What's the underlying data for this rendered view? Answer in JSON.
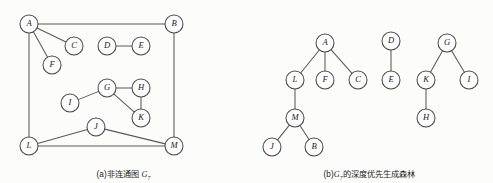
{
  "figure": {
    "panels": [
      {
        "id": "panel-a",
        "caption_prefix": "(a)",
        "caption_text": "非连通图",
        "caption_symbol": "G",
        "caption_subscript": "7",
        "type": "undirected-graph",
        "node_radius": 9,
        "nodes": [
          {
            "label": "A",
            "x": 29,
            "y": 24
          },
          {
            "label": "B",
            "x": 174,
            "y": 24
          },
          {
            "label": "C",
            "x": 74,
            "y": 46
          },
          {
            "label": "D",
            "x": 107,
            "y": 46
          },
          {
            "label": "E",
            "x": 141,
            "y": 46
          },
          {
            "label": "F",
            "x": 52,
            "y": 65
          },
          {
            "label": "G",
            "x": 107,
            "y": 88
          },
          {
            "label": "H",
            "x": 141,
            "y": 88
          },
          {
            "label": "I",
            "x": 70,
            "y": 103
          },
          {
            "label": "K",
            "x": 141,
            "y": 118
          },
          {
            "label": "J",
            "x": 96,
            "y": 127
          },
          {
            "label": "L",
            "x": 29,
            "y": 146
          },
          {
            "label": "M",
            "x": 174,
            "y": 146
          }
        ],
        "edges": [
          [
            "A",
            "B"
          ],
          [
            "A",
            "C"
          ],
          [
            "A",
            "F"
          ],
          [
            "A",
            "L"
          ],
          [
            "B",
            "M"
          ],
          [
            "D",
            "E"
          ],
          [
            "G",
            "H"
          ],
          [
            "G",
            "I"
          ],
          [
            "G",
            "K"
          ],
          [
            "H",
            "K"
          ],
          [
            "J",
            "L"
          ],
          [
            "J",
            "M"
          ],
          [
            "L",
            "M"
          ]
        ]
      },
      {
        "id": "panel-b",
        "caption_prefix": "(b)",
        "caption_symbol": "G",
        "caption_subscript": "7",
        "caption_text": "的深度优先生成森林",
        "type": "spanning-forest",
        "node_radius": 9,
        "nodes": [
          {
            "label": "A",
            "x": 79,
            "y": 43
          },
          {
            "label": "L",
            "x": 49,
            "y": 80
          },
          {
            "label": "F",
            "x": 79,
            "y": 80
          },
          {
            "label": "C",
            "x": 112,
            "y": 80
          },
          {
            "label": "M",
            "x": 49,
            "y": 118
          },
          {
            "label": "J",
            "x": 26,
            "y": 147
          },
          {
            "label": "B",
            "x": 68,
            "y": 147
          },
          {
            "label": "D",
            "x": 145,
            "y": 41
          },
          {
            "label": "E",
            "x": 145,
            "y": 80
          },
          {
            "label": "G",
            "x": 201,
            "y": 43
          },
          {
            "label": "K",
            "x": 180,
            "y": 80
          },
          {
            "label": "I",
            "x": 223,
            "y": 80
          },
          {
            "label": "H",
            "x": 180,
            "y": 118
          }
        ],
        "edges": [
          [
            "A",
            "L"
          ],
          [
            "A",
            "F"
          ],
          [
            "A",
            "C"
          ],
          [
            "L",
            "M"
          ],
          [
            "M",
            "J"
          ],
          [
            "M",
            "B"
          ],
          [
            "D",
            "E"
          ],
          [
            "G",
            "K"
          ],
          [
            "G",
            "I"
          ],
          [
            "K",
            "H"
          ]
        ]
      }
    ]
  },
  "colors": {
    "stroke": "#4a4a4a",
    "edge": "#595959",
    "label": "#1b1b1b",
    "background": "#fcfcfb"
  }
}
